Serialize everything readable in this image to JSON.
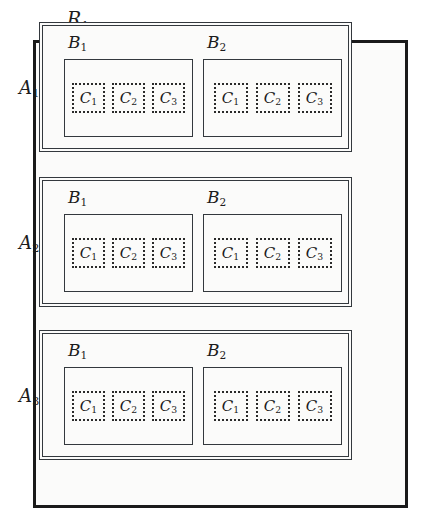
{
  "diagram": {
    "title": "R1",
    "type": "nested-containment-hierarchy",
    "root": {
      "name": "R",
      "index": "1",
      "label_base": "R",
      "label_sub": "1"
    },
    "levels": [
      "R",
      "A",
      "B",
      "C"
    ],
    "a_groups": [
      {
        "label_base": "A",
        "label_sub": "1",
        "b_groups": [
          {
            "label_base": "B",
            "label_sub": "1",
            "c_items": [
              {
                "label_base": "C",
                "label_sub": "1"
              },
              {
                "label_base": "C",
                "label_sub": "2"
              },
              {
                "label_base": "C",
                "label_sub": "3"
              }
            ]
          },
          {
            "label_base": "B",
            "label_sub": "2",
            "c_items": [
              {
                "label_base": "C",
                "label_sub": "1"
              },
              {
                "label_base": "C",
                "label_sub": "2"
              },
              {
                "label_base": "C",
                "label_sub": "3"
              }
            ]
          }
        ]
      },
      {
        "label_base": "A",
        "label_sub": "2",
        "b_groups": [
          {
            "label_base": "B",
            "label_sub": "1",
            "c_items": [
              {
                "label_base": "C",
                "label_sub": "1"
              },
              {
                "label_base": "C",
                "label_sub": "2"
              },
              {
                "label_base": "C",
                "label_sub": "3"
              }
            ]
          },
          {
            "label_base": "B",
            "label_sub": "2",
            "c_items": [
              {
                "label_base": "C",
                "label_sub": "1"
              },
              {
                "label_base": "C",
                "label_sub": "2"
              },
              {
                "label_base": "C",
                "label_sub": "3"
              }
            ]
          }
        ]
      },
      {
        "label_base": "A",
        "label_sub": "3",
        "b_groups": [
          {
            "label_base": "B",
            "label_sub": "1",
            "c_items": [
              {
                "label_base": "C",
                "label_sub": "1"
              },
              {
                "label_base": "C",
                "label_sub": "2"
              },
              {
                "label_base": "C",
                "label_sub": "3"
              }
            ]
          },
          {
            "label_base": "B",
            "label_sub": "2",
            "c_items": [
              {
                "label_base": "C",
                "label_sub": "1"
              },
              {
                "label_base": "C",
                "label_sub": "2"
              },
              {
                "label_base": "C",
                "label_sub": "3"
              }
            ]
          }
        ]
      }
    ],
    "colors": {
      "page_background": "#ffffff",
      "box_fill": "#fbfbfa",
      "outer_border": "#1a1a1a",
      "inner_border": "#33383d",
      "dotted_border": "#2a2a2a",
      "text": "#1c1c1c"
    },
    "border_styles": {
      "root": "solid-thick",
      "a_group": "double",
      "b_group": "solid-thin",
      "c_item": "dotted"
    }
  }
}
